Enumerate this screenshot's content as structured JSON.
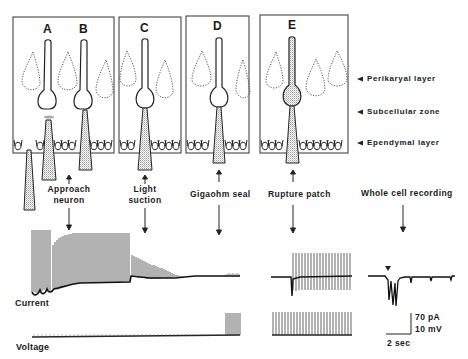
{
  "figure": {
    "panels": [
      {
        "id": "A",
        "label": "A"
      },
      {
        "id": "B",
        "label": "B"
      },
      {
        "id": "C",
        "label": "C"
      },
      {
        "id": "D",
        "label": "D"
      },
      {
        "id": "E",
        "label": "E"
      }
    ],
    "layers": [
      {
        "label": "Perikaryal layer"
      },
      {
        "label": "Subcellular zone"
      },
      {
        "label": "Ependymal layer"
      }
    ],
    "steps": [
      {
        "line1": "Approach",
        "line2": "neuron"
      },
      {
        "line1": "Light",
        "line2": "suction"
      },
      {
        "line1": "Gigaohm seal",
        "line2": ""
      },
      {
        "line1": "Rupture patch",
        "line2": ""
      },
      {
        "line1": "Whole cell recording",
        "line2": ""
      }
    ],
    "traces": {
      "current_label": "Current",
      "voltage_label": "Voltage"
    },
    "scale_bar": {
      "current": "70 pA",
      "voltage": "10 mV",
      "time": "2 sec"
    }
  }
}
